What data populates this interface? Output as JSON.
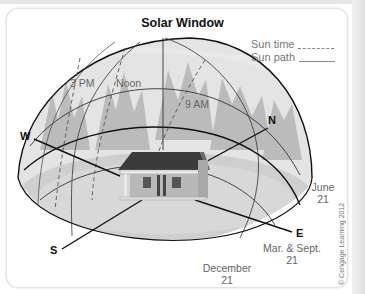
{
  "figure": {
    "title": "Solar Window",
    "legend": [
      {
        "label": "Sun time",
        "style": "dashed"
      },
      {
        "label": "Sun path",
        "style": "solid"
      }
    ],
    "time_labels": {
      "three_pm": "3 PM",
      "noon": "Noon",
      "nine_am": "9 AM"
    },
    "directions": {
      "west": "W",
      "north": "N",
      "east": "E",
      "south": "S"
    },
    "path_labels": {
      "june": [
        "June",
        "21"
      ],
      "equinox": [
        "Mar. & Sept.",
        "21"
      ],
      "december": [
        "December",
        "21"
      ]
    },
    "credit": "© Cengage Learning 2012",
    "colors": {
      "dome_fill": "#d9d9d9",
      "ground_fill": "#c8c8c8",
      "trees": "#a8a8a8",
      "roof": "#3a3a3a",
      "house_wall": "#b8b8b8"
    }
  }
}
